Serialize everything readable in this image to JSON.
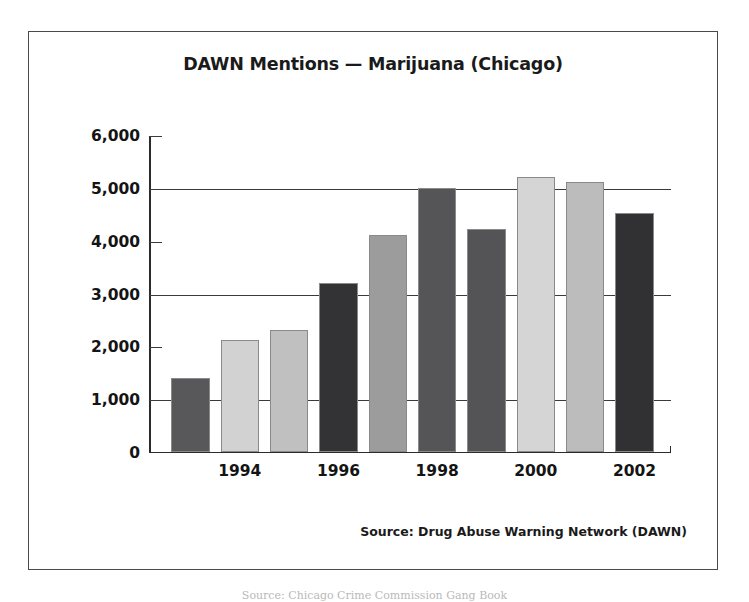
{
  "figure": {
    "title": "DAWN Mentions — Marijuana (Chicago)",
    "source_note": "Source: Drug Abuse Warning Network (DAWN)",
    "page_caption": "Source: Chicago Crime Commission Gang Book",
    "frame_color": "#4a4a4a",
    "background_color": "#ffffff"
  },
  "chart_data": {
    "type": "bar",
    "title": "DAWN Mentions — Marijuana (Chicago)",
    "xlabel": "",
    "ylabel": "",
    "ylim": [
      0,
      6000
    ],
    "ytick_values": [
      0,
      1000,
      2000,
      3000,
      4000,
      5000,
      6000
    ],
    "ytick_labels": [
      "0",
      "1,000",
      "2,000",
      "3,000",
      "4,000",
      "5,000",
      "6,000"
    ],
    "major_gridlines_at": [
      1000,
      3000,
      5000
    ],
    "minor_ticks_at": [
      2000,
      4000,
      6000
    ],
    "grid": true,
    "legend": false,
    "categories": [
      "1993",
      "1994",
      "1995",
      "1996",
      "1997",
      "1998",
      "1999",
      "2000",
      "2001",
      "2002"
    ],
    "xtick_labels_shown": [
      "1994",
      "1996",
      "1998",
      "2000",
      "2002"
    ],
    "values": [
      1400,
      2120,
      2320,
      3200,
      4120,
      5010,
      4230,
      5230,
      5130,
      4530
    ],
    "bar_colors": [
      "#58585a",
      "#d2d2d2",
      "#c0c0c0",
      "#333335",
      "#9c9c9c",
      "#555558",
      "#545457",
      "#d5d5d5",
      "#bcbcbc",
      "#313133"
    ],
    "bar_edge_color": "#8a8a8a",
    "axis_color": "#2b2b2b"
  }
}
